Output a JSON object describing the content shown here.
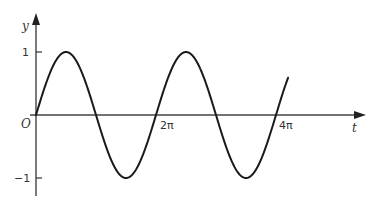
{
  "chart_data": {
    "type": "line",
    "title": "",
    "xlabel": "t",
    "ylabel": "y",
    "origin_label": "O",
    "x_ticks": [
      {
        "value": 6.283185,
        "label": "2π"
      },
      {
        "value": 12.566371,
        "label": "4π"
      }
    ],
    "y_ticks": [
      {
        "value": 1,
        "label": "1"
      },
      {
        "value": -1,
        "label": "−1"
      }
    ],
    "xlim": [
      0,
      17.4
    ],
    "ylim": [
      -1.3,
      1.6
    ],
    "grid": false,
    "legend": null,
    "series": [
      {
        "name": "y = sin t",
        "function": "sin",
        "t_start": 0,
        "t_end": 13.2,
        "x": [
          0,
          1.5708,
          3.1416,
          4.7124,
          6.2832,
          7.854,
          9.4248,
          10.9956,
          12.5664,
          13.2
        ],
        "values": [
          0,
          1,
          0,
          -1,
          0,
          1,
          0,
          -1,
          0,
          0.59
        ]
      }
    ],
    "colors": {
      "curve": "#1a1a1a",
      "axes": "#333333",
      "background": "#ffffff"
    }
  },
  "labels": {
    "y_axis": "y",
    "t_axis": "t",
    "origin": "O",
    "tick_y_pos": "1",
    "tick_y_neg": "−1",
    "tick_2pi": "2π",
    "tick_4pi": "4π"
  }
}
